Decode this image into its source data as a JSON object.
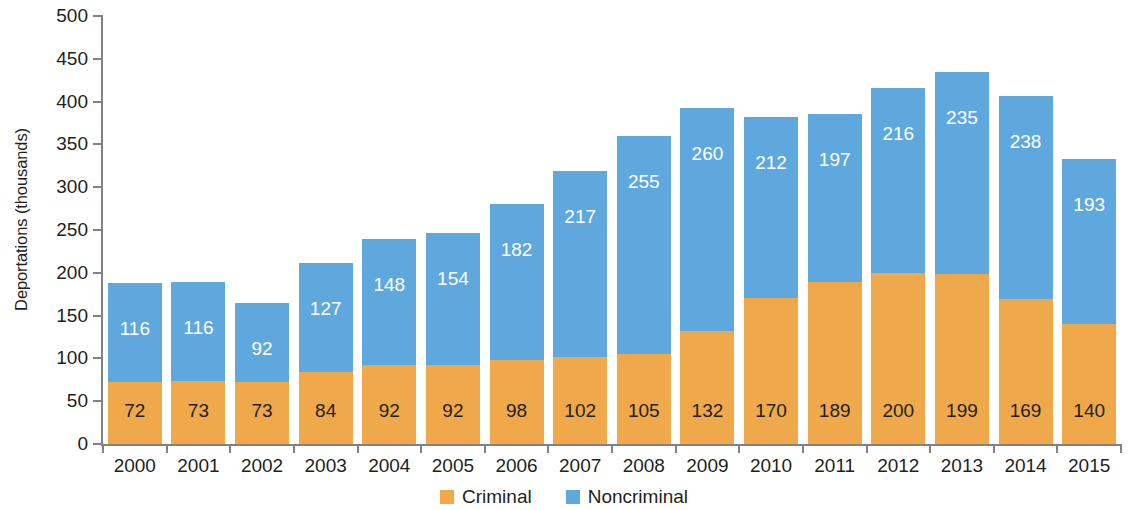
{
  "chart_data": {
    "type": "bar",
    "stacked": true,
    "title": "",
    "xlabel": "",
    "ylabel": "Deportations (thousands)",
    "ylim": [
      0,
      500
    ],
    "yticks": [
      0,
      50,
      100,
      150,
      200,
      250,
      300,
      350,
      400,
      450,
      500
    ],
    "grid": false,
    "legend_position": "bottom",
    "categories": [
      "2000",
      "2001",
      "2002",
      "2003",
      "2004",
      "2005",
      "2006",
      "2007",
      "2008",
      "2009",
      "2010",
      "2011",
      "2012",
      "2013",
      "2014",
      "2015"
    ],
    "series": [
      {
        "name": "Criminal",
        "color": "#efa94a",
        "values": [
          72,
          73,
          73,
          84,
          92,
          92,
          98,
          102,
          105,
          132,
          170,
          189,
          200,
          199,
          169,
          140
        ]
      },
      {
        "name": "Noncriminal",
        "color": "#5fa8dd",
        "values": [
          116,
          116,
          92,
          127,
          148,
          154,
          182,
          217,
          255,
          260,
          212,
          197,
          216,
          235,
          238,
          193
        ]
      }
    ],
    "totals": [
      188,
      189,
      165,
      211,
      240,
      246,
      280,
      319,
      360,
      392,
      382,
      386,
      416,
      434,
      407,
      333
    ]
  },
  "axis": {
    "y_title": "Deportations (thousands)"
  },
  "legend": {
    "items": [
      {
        "label": "Criminal",
        "color": "#efa94a",
        "swatch_name": "legend-swatch-criminal"
      },
      {
        "label": "Noncriminal",
        "color": "#5fa8dd",
        "swatch_name": "legend-swatch-noncriminal"
      }
    ]
  }
}
